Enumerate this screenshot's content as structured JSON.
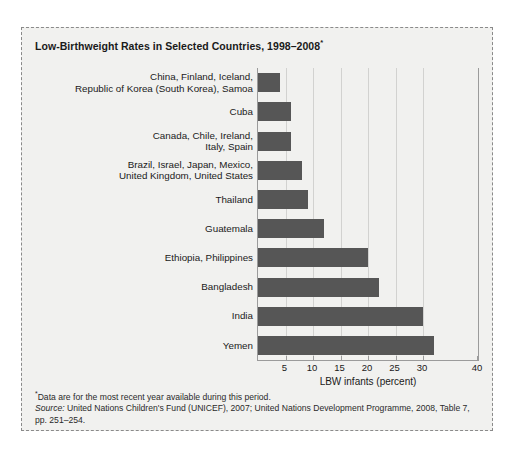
{
  "figure": {
    "title": "Low-Birthweight Rates in Selected Countries, 1998–2008",
    "title_superscript": "*",
    "background_color": "#f1f1ef",
    "bar_color": "#565656",
    "gridline_color": "#d2d2d0",
    "axis_color": "#9b9b9b"
  },
  "chart_data": {
    "type": "bar",
    "orientation": "horizontal",
    "title": "Low-Birthweight Rates in Selected Countries, 1998–2008*",
    "xlabel": "LBW infants (percent)",
    "ylabel": "",
    "xlim": [
      0,
      40
    ],
    "xticks": [
      5,
      10,
      15,
      20,
      25,
      30,
      40
    ],
    "xticklabels": [
      "5",
      "10",
      "15",
      "20",
      "25",
      "30",
      "40"
    ],
    "grid": "vertical",
    "legend": "none",
    "categories": [
      "China, Finland, Iceland,\nRepublic of Korea (South Korea), Samoa",
      "Cuba",
      "Canada, Chile, Ireland,\nItaly, Spain",
      "Brazil, Israel, Japan, Mexico,\nUnited Kingdom, United States",
      "Thailand",
      "Guatemala",
      "Ethiopia, Philippines",
      "Bangladesh",
      "India",
      "Yemen"
    ],
    "values": [
      4,
      6,
      6,
      8,
      9,
      12,
      20,
      22,
      30,
      32
    ],
    "unit": "percent"
  },
  "footnotes": {
    "asterisk": "*",
    "note": "Data are for the most recent year available during this period.",
    "source_label": "Source:",
    "source_text": " United Nations Children's Fund (UNICEF), 2007; United Nations Development Programme, 2008, Table 7, pp. 251–254."
  }
}
